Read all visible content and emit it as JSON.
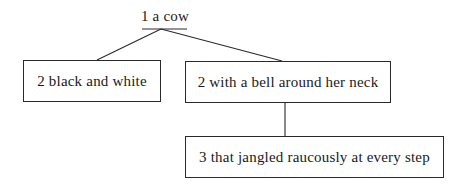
{
  "diagram": {
    "type": "tree",
    "root": {
      "level": "1",
      "label": "1 a cow"
    },
    "nodes": [
      {
        "id": "black-white",
        "level": "2",
        "label": "2 black and white",
        "parent": "root"
      },
      {
        "id": "bell",
        "level": "2",
        "label": "2 with a bell around her neck",
        "parent": "root"
      },
      {
        "id": "jangled",
        "level": "3",
        "label": "3 that jangled raucously at every step",
        "parent": "bell"
      }
    ],
    "colors": {
      "line": "#2a2a2a",
      "background": "#ffffff",
      "text": "#1a1a1a"
    }
  }
}
